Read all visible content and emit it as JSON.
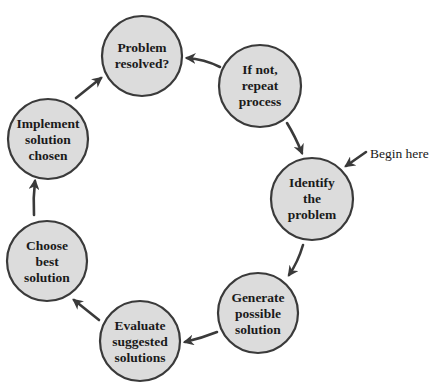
{
  "diagram": {
    "type": "cycle",
    "colors": {
      "node_fill": "#dcdcdc",
      "node_stroke": "#3a3a3a",
      "arrow": "#3a3a3a",
      "text": "#1a1a1a",
      "background": "#ffffff"
    },
    "start_label": "Begin here",
    "nodes": [
      {
        "id": "identify",
        "lines": [
          "Identify",
          "the",
          "problem"
        ]
      },
      {
        "id": "generate",
        "lines": [
          "Generate",
          "possible",
          "solution"
        ]
      },
      {
        "id": "evaluate",
        "lines": [
          "Evaluate",
          "suggested",
          "solutions"
        ]
      },
      {
        "id": "choose",
        "lines": [
          "Choose",
          "best",
          "solution"
        ]
      },
      {
        "id": "implement",
        "lines": [
          "Implement",
          "solution",
          "chosen"
        ]
      },
      {
        "id": "resolved",
        "lines": [
          "Problem",
          "resolved?"
        ]
      },
      {
        "id": "repeat",
        "lines": [
          "If not,",
          "repeat",
          "process"
        ]
      }
    ],
    "edges": [
      {
        "from": "identify",
        "to": "generate"
      },
      {
        "from": "generate",
        "to": "evaluate"
      },
      {
        "from": "evaluate",
        "to": "choose"
      },
      {
        "from": "choose",
        "to": "implement"
      },
      {
        "from": "implement",
        "to": "resolved"
      },
      {
        "from": "repeat",
        "to": "resolved"
      },
      {
        "from": "repeat",
        "to": "identify"
      }
    ]
  }
}
